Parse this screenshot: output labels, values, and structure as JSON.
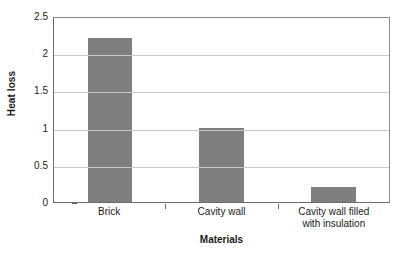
{
  "chart_data": {
    "type": "bar",
    "title": "",
    "xlabel": "Materials",
    "ylabel": "Heat loss",
    "categories": [
      "Brick",
      "Cavity wall",
      "Cavity wall filled\nwith insulation"
    ],
    "values": [
      2.2,
      1.0,
      0.2
    ],
    "ylim": [
      0,
      2.5
    ],
    "yticks": [
      "0",
      "0.5",
      "1",
      "1.5",
      "2",
      "2.5"
    ],
    "ytick_values": [
      0,
      0.5,
      1,
      1.5,
      2,
      2.5
    ],
    "grid": "horizontal",
    "legend": "none",
    "colors": {
      "bar": "#7f7f7f",
      "gridline": "#c9c9c9",
      "axis": "#6b6b6b",
      "text": "#1a1a1a",
      "background": "#ffffff"
    }
  }
}
